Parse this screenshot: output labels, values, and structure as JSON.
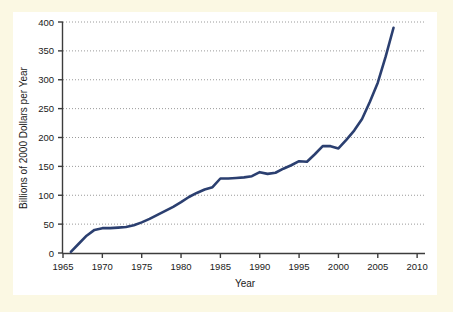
{
  "figure": {
    "background_color": "#fbf8e3",
    "panel_color": "#ffffff",
    "line_color": "#2b3f70",
    "axis_color": "#3c3c3c",
    "grid_color": "#9a9a9a"
  },
  "chart_data": {
    "type": "line",
    "title": "",
    "subtitle": "",
    "xlabel": "Year",
    "ylabel": "Billions of 2000 Dollars per Year",
    "xlim": [
      1965,
      2011
    ],
    "ylim": [
      0,
      400
    ],
    "xticks": [
      1965,
      1970,
      1975,
      1980,
      1985,
      1990,
      1995,
      2000,
      2005,
      2010
    ],
    "xtick_labels": [
      "1965",
      "1970",
      "1975",
      "1980",
      "1985",
      "1990",
      "1995",
      "2000",
      "2005",
      "2010"
    ],
    "yticks": [
      0,
      50,
      100,
      150,
      200,
      250,
      300,
      350,
      400
    ],
    "ytick_labels": [
      "0",
      "50",
      "100",
      "150",
      "200",
      "250",
      "300",
      "350",
      "400"
    ],
    "grid": "horizontal-dotted",
    "legend": "none",
    "series": [
      {
        "name": "Value",
        "x": [
          1966,
          1967,
          1968,
          1969,
          1970,
          1971,
          1972,
          1973,
          1974,
          1975,
          1976,
          1977,
          1978,
          1979,
          1980,
          1981,
          1982,
          1983,
          1984,
          1985,
          1986,
          1987,
          1988,
          1989,
          1990,
          1991,
          1992,
          1993,
          1994,
          1995,
          1996,
          1997,
          1998,
          1999,
          2000,
          2001,
          2002,
          2003,
          2004,
          2005,
          2006,
          2007
        ],
        "values": [
          2,
          16,
          30,
          40,
          43,
          43,
          44,
          45,
          48,
          53,
          59,
          66,
          73,
          80,
          88,
          97,
          104,
          110,
          114,
          129,
          129,
          130,
          131,
          133,
          140,
          137,
          139,
          146,
          152,
          159,
          158,
          171,
          185,
          185,
          181,
          196,
          212,
          232,
          262,
          295,
          340,
          390
        ]
      }
    ]
  }
}
